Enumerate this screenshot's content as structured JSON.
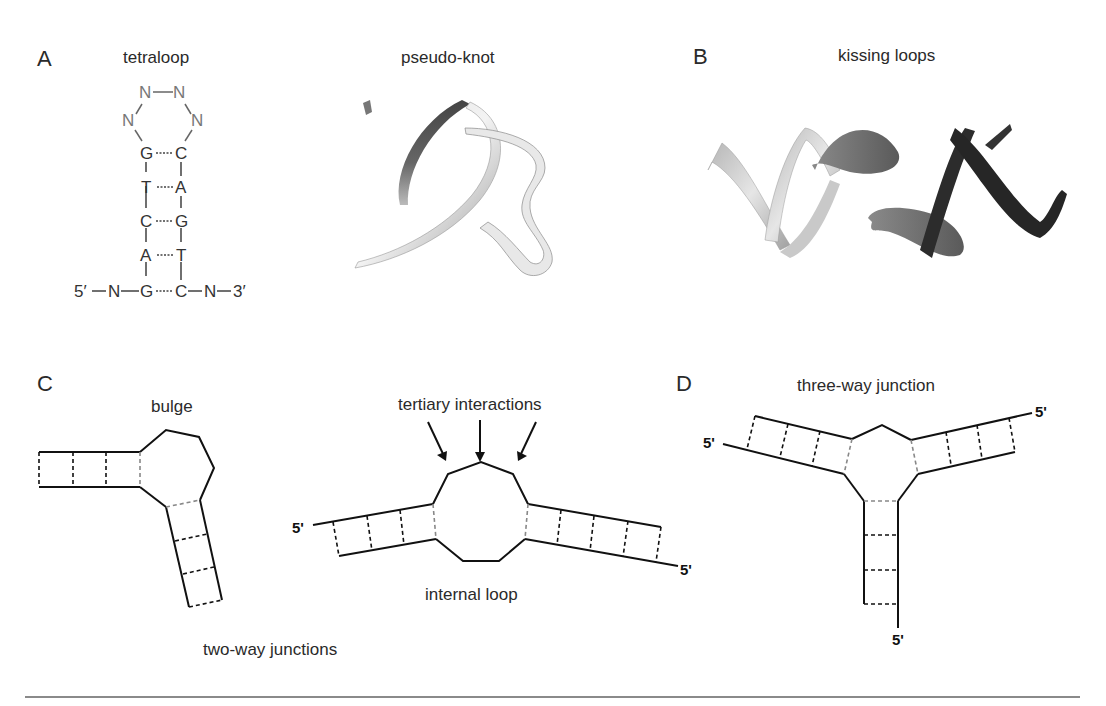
{
  "figure": {
    "panels": {
      "A": {
        "letter": "A",
        "tetraloop": {
          "title": "tetraloop",
          "loop_nucleotides": [
            "N",
            "N",
            "N",
            "N"
          ],
          "stem_pairs": [
            {
              "left": "G",
              "right": "C"
            },
            {
              "left": "T",
              "right": "A"
            },
            {
              "left": "C",
              "right": "G"
            },
            {
              "left": "A",
              "right": "T"
            },
            {
              "left": "G",
              "right": "C"
            }
          ],
          "flank_left": "5′—N—",
          "flank_right": "—N—3′",
          "five_prime": "5′",
          "three_prime": "3′",
          "flank_nucleotide": "N"
        },
        "pseudoknot": {
          "title": "pseudo-knot"
        }
      },
      "B": {
        "letter": "B",
        "title": "kissing loops"
      },
      "C": {
        "letter": "C",
        "bulge_label": "bulge",
        "tertiary_label": "tertiary interactions",
        "internal_loop_label": "internal loop",
        "group_label": "two-way junctions",
        "five_prime_left": "5'",
        "five_prime_right": "5'"
      },
      "D": {
        "letter": "D",
        "title": "three-way junction",
        "five_prime_left": "5'",
        "five_prime_right": "5'",
        "five_prime_bottom": "5'"
      }
    },
    "colors": {
      "line": "#111111",
      "text": "#2a2a2a",
      "loop_nucleotide": "#777777",
      "divider": "#8a8a8a"
    }
  }
}
